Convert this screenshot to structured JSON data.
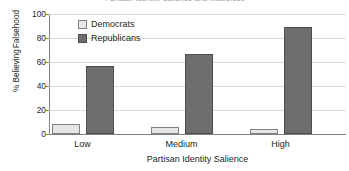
{
  "figure": {
    "title_sliver": "Partisan Identity Salience and Misperceptions",
    "ylabel_line1": "% Believing",
    "ylabel_line2": "Falsehood",
    "xlabel": "Partisan Identity Salience"
  },
  "legend": {
    "position": "inside-top-left",
    "entries": [
      {
        "label": "Democrats",
        "color": "#e6e6e6"
      },
      {
        "label": "Republicans",
        "color": "#6e6e6e"
      }
    ]
  },
  "yticks": [
    "100",
    "80",
    "60",
    "40",
    "20",
    "0"
  ],
  "xticks": [
    "Low",
    "Medium",
    "High"
  ],
  "chart_data": {
    "type": "bar",
    "title": "",
    "xlabel": "Partisan Identity Salience",
    "ylabel": "% Believing Falsehood",
    "categories": [
      "Low",
      "Medium",
      "High"
    ],
    "series": [
      {
        "name": "Democrats",
        "color": "#e6e6e6",
        "values": [
          8,
          6,
          4
        ]
      },
      {
        "name": "Republicans",
        "color": "#6e6e6e",
        "values": [
          57,
          67,
          89
        ]
      }
    ],
    "ylim": [
      0,
      100
    ],
    "ytick_values": [
      0,
      20,
      40,
      60,
      80,
      100
    ],
    "grid": "horizontal",
    "legend_position": "inside top-left"
  }
}
